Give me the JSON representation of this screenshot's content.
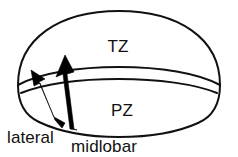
{
  "figure": {
    "background_color": "#ffffff",
    "line_color": "#111111",
    "arrow_color": "#000000",
    "zones": [
      {
        "id": "tz",
        "label": "TZ",
        "name": "transition-zone",
        "label_x": 118,
        "label_y": 52
      },
      {
        "id": "pz",
        "label": "PZ",
        "name": "peripheral-zone",
        "label_x": 122,
        "label_y": 116
      }
    ],
    "callouts": [
      {
        "id": "lateral",
        "label": "lateral",
        "name": "lateral-approach",
        "label_x": 7,
        "label_y": 143
      },
      {
        "id": "midlobar",
        "label": "midlobar",
        "name": "midlobar-approach",
        "label_x": 71,
        "label_y": 152
      }
    ]
  }
}
